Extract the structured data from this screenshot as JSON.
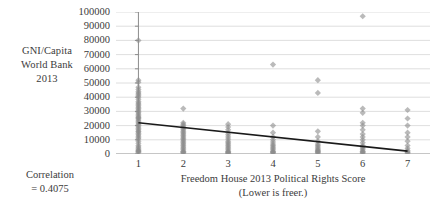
{
  "labels": {
    "y_axis_title_line1": "GNI/Capita",
    "y_axis_title_line2": "World Bank",
    "y_axis_title_line3": "2013",
    "correlation_line1": "Correlation",
    "correlation_line2": "= 0.4075",
    "x_axis_title_line1": "Freedom House 2013 Political Rights Score",
    "x_axis_title_line2": "(Lower is freer.)"
  },
  "colors": {
    "marker": "#8c8c8c",
    "trendline": "#1a1a1a",
    "gridline": "#d6d6d6",
    "axis": "#8c8c8c",
    "text": "#3b3b3b",
    "background": "#ffffff"
  },
  "chart_data": {
    "type": "scatter",
    "title": "",
    "xlabel": "Freedom House 2013 Political Rights Score (Lower is freer.)",
    "ylabel": "GNI/Capita World Bank 2013",
    "xlim": [
      0.5,
      7.5
    ],
    "ylim": [
      0,
      100000
    ],
    "xticks": [
      1,
      2,
      3,
      4,
      5,
      6,
      7
    ],
    "xtick_labels": [
      "1",
      "2",
      "3",
      "4",
      "5",
      "6",
      "7"
    ],
    "yticks": [
      0,
      10000,
      20000,
      30000,
      40000,
      50000,
      60000,
      70000,
      80000,
      90000,
      100000
    ],
    "ytick_labels": [
      "0",
      "10000",
      "20000",
      "30000",
      "40000",
      "50000",
      "60000",
      "70000",
      "80000",
      "90000",
      "100000"
    ],
    "grid": "horizontal",
    "legend": "none",
    "correlation": 0.4075,
    "marker_shape": "diamond",
    "marker_opacity": 0.6,
    "series": [
      {
        "name": "Countries",
        "points": [
          [
            1,
            80000
          ],
          [
            1,
            52000
          ],
          [
            1,
            50500
          ],
          [
            1,
            47000
          ],
          [
            1,
            45500
          ],
          [
            1,
            44000
          ],
          [
            1,
            43000
          ],
          [
            1,
            42000
          ],
          [
            1,
            41000
          ],
          [
            1,
            40000
          ],
          [
            1,
            38500
          ],
          [
            1,
            37000
          ],
          [
            1,
            36000
          ],
          [
            1,
            35000
          ],
          [
            1,
            34000
          ],
          [
            1,
            33000
          ],
          [
            1,
            32000
          ],
          [
            1,
            31000
          ],
          [
            1,
            30000
          ],
          [
            1,
            29000
          ],
          [
            1,
            28000
          ],
          [
            1,
            27000
          ],
          [
            1,
            26000
          ],
          [
            1,
            25500
          ],
          [
            1,
            25000
          ],
          [
            1,
            24000
          ],
          [
            1,
            23000
          ],
          [
            1,
            22000
          ],
          [
            1,
            21000
          ],
          [
            1,
            20000
          ],
          [
            1,
            19000
          ],
          [
            1,
            18000
          ],
          [
            1,
            17000
          ],
          [
            1,
            16000
          ],
          [
            1,
            15500
          ],
          [
            1,
            14500
          ],
          [
            1,
            13500
          ],
          [
            1,
            12500
          ],
          [
            1,
            11500
          ],
          [
            1,
            10500
          ],
          [
            1,
            9000
          ],
          [
            1,
            7500
          ],
          [
            1,
            6000
          ],
          [
            1,
            5000
          ],
          [
            1,
            4000
          ],
          [
            1,
            3000
          ],
          [
            1,
            2500
          ],
          [
            1,
            2000
          ],
          [
            1,
            1500
          ],
          [
            1,
            1000
          ],
          [
            2,
            32000
          ],
          [
            2,
            22000
          ],
          [
            2,
            21000
          ],
          [
            2,
            20000
          ],
          [
            2,
            19000
          ],
          [
            2,
            18000
          ],
          [
            2,
            17000
          ],
          [
            2,
            16000
          ],
          [
            2,
            15000
          ],
          [
            2,
            14000
          ],
          [
            2,
            13000
          ],
          [
            2,
            12000
          ],
          [
            2,
            11000
          ],
          [
            2,
            10000
          ],
          [
            2,
            9000
          ],
          [
            2,
            8000
          ],
          [
            2,
            7000
          ],
          [
            2,
            6000
          ],
          [
            2,
            5000
          ],
          [
            2,
            4000
          ],
          [
            2,
            3000
          ],
          [
            2,
            2000
          ],
          [
            2,
            1500
          ],
          [
            2,
            1000
          ],
          [
            2,
            700
          ],
          [
            3,
            21000
          ],
          [
            3,
            19000
          ],
          [
            3,
            17000
          ],
          [
            3,
            15000
          ],
          [
            3,
            13500
          ],
          [
            3,
            12000
          ],
          [
            3,
            10500
          ],
          [
            3,
            9000
          ],
          [
            3,
            8000
          ],
          [
            3,
            7000
          ],
          [
            3,
            6000
          ],
          [
            3,
            5000
          ],
          [
            3,
            4000
          ],
          [
            3,
            3000
          ],
          [
            3,
            2000
          ],
          [
            3,
            1500
          ],
          [
            3,
            1000
          ],
          [
            3,
            700
          ],
          [
            3,
            500
          ],
          [
            4,
            63000
          ],
          [
            4,
            20000
          ],
          [
            4,
            15000
          ],
          [
            4,
            12000
          ],
          [
            4,
            10000
          ],
          [
            4,
            8500
          ],
          [
            4,
            7000
          ],
          [
            4,
            6000
          ],
          [
            4,
            5000
          ],
          [
            4,
            4000
          ],
          [
            4,
            3000
          ],
          [
            4,
            2000
          ],
          [
            4,
            1500
          ],
          [
            4,
            1000
          ],
          [
            4,
            700
          ],
          [
            5,
            52000
          ],
          [
            5,
            43000
          ],
          [
            5,
            16000
          ],
          [
            5,
            12000
          ],
          [
            5,
            9000
          ],
          [
            5,
            7000
          ],
          [
            5,
            6000
          ],
          [
            5,
            5000
          ],
          [
            5,
            4000
          ],
          [
            5,
            3000
          ],
          [
            5,
            2500
          ],
          [
            5,
            2000
          ],
          [
            5,
            1500
          ],
          [
            5,
            1000
          ],
          [
            5,
            600
          ],
          [
            6,
            97000
          ],
          [
            6,
            32000
          ],
          [
            6,
            29000
          ],
          [
            6,
            22000
          ],
          [
            6,
            20000
          ],
          [
            6,
            17000
          ],
          [
            6,
            14000
          ],
          [
            6,
            12000
          ],
          [
            6,
            10000
          ],
          [
            6,
            8000
          ],
          [
            6,
            6000
          ],
          [
            6,
            5000
          ],
          [
            6,
            4000
          ],
          [
            6,
            3000
          ],
          [
            6,
            2000
          ],
          [
            6,
            1500
          ],
          [
            6,
            1000
          ],
          [
            6,
            600
          ],
          [
            7,
            31000
          ],
          [
            7,
            25000
          ],
          [
            7,
            20000
          ],
          [
            7,
            15000
          ],
          [
            7,
            12000
          ],
          [
            7,
            9000
          ],
          [
            7,
            6000
          ],
          [
            7,
            4000
          ],
          [
            7,
            2500
          ],
          [
            7,
            1500
          ],
          [
            7,
            1000
          ],
          [
            7,
            600
          ]
        ]
      }
    ],
    "trendline": {
      "x_start": 1,
      "y_start": 22000,
      "x_end": 7,
      "y_end": 2000
    }
  }
}
